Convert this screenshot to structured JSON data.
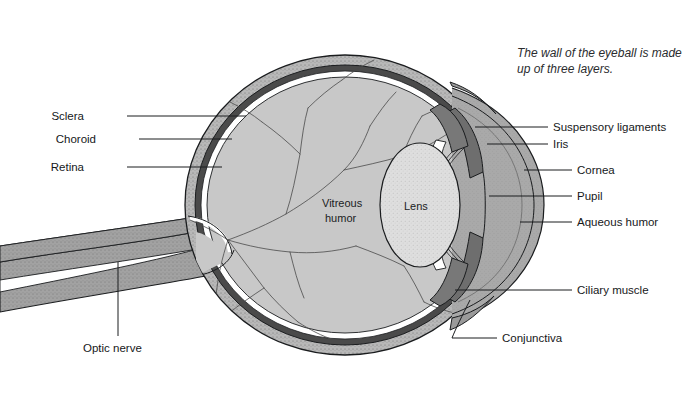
{
  "figure": {
    "note": {
      "line1": "The wall of the eyeball is made",
      "line2": "up of three layers."
    }
  },
  "labels_left": [
    {
      "id": "sclera",
      "text": "Sclera"
    },
    {
      "id": "choroid",
      "text": "Choroid"
    },
    {
      "id": "retina",
      "text": "Retina"
    }
  ],
  "labels_right": [
    {
      "id": "suspensory-ligaments",
      "text": "Suspensory ligaments"
    },
    {
      "id": "iris",
      "text": "Iris"
    },
    {
      "id": "cornea",
      "text": "Cornea"
    },
    {
      "id": "pupil",
      "text": "Pupil"
    },
    {
      "id": "aqueous-humor",
      "text": "Aqueous humor"
    },
    {
      "id": "ciliary-muscle",
      "text": "Ciliary muscle"
    },
    {
      "id": "conjunctiva",
      "text": "Conjunctiva"
    }
  ],
  "labels_inner": [
    {
      "id": "vitreous-humor-1",
      "text": "Vitreous"
    },
    {
      "id": "vitreous-humor-2",
      "text": "humor"
    },
    {
      "id": "lens",
      "text": "Lens"
    }
  ],
  "labels_bottom": [
    {
      "id": "optic-nerve",
      "text": "Optic nerve"
    }
  ],
  "colors": {
    "background": "#ffffff",
    "vitreous": "#c8c8c8",
    "aqueous": "#a8a8a8",
    "sclera": "#b5b5b5",
    "choroid": "#4a4a4a",
    "retina": "#ffffff",
    "lens": "#dcdcdc",
    "iris": "#6e6e6e",
    "nerve": "#9a9a9a",
    "outline": "#1a1c1e",
    "text": "#16181a"
  }
}
